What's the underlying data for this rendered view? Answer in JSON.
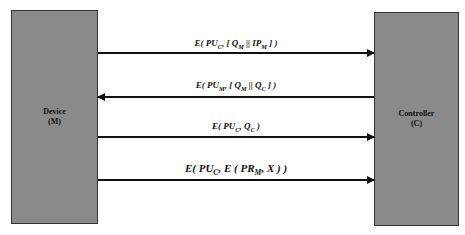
{
  "entities": {
    "device": {
      "name": "Device",
      "id": "(M)"
    },
    "controller": {
      "name": "Controller",
      "id": "(C)"
    }
  },
  "messages": [
    {
      "direction": "device-to-controller",
      "label_parts": [
        "E( PU",
        "C",
        ", [ Q",
        "M",
        " || IP",
        "M",
        " ] )"
      ]
    },
    {
      "direction": "controller-to-device",
      "label_parts": [
        "E( PU",
        "M",
        ", [ Q",
        "M",
        " || Q",
        "C",
        " ] )"
      ]
    },
    {
      "direction": "device-to-controller",
      "label_parts": [
        "E( PU",
        "C",
        ", Q",
        "C",
        " )"
      ]
    },
    {
      "direction": "device-to-controller",
      "label_parts": [
        "E( PU",
        "C",
        ", E ( PR",
        "M",
        ", X ) )"
      ]
    }
  ],
  "colors": {
    "box_fill": "#8a8a8a",
    "line": "#111111"
  }
}
